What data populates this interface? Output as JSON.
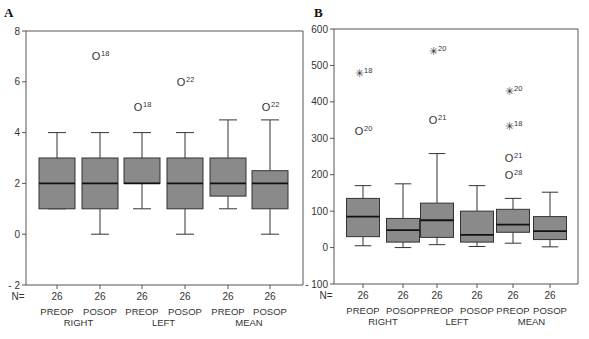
{
  "chart_data": [
    {
      "type": "boxplot",
      "panel_label": "A",
      "ylim": [
        -2,
        8
      ],
      "yticks": [
        -2,
        0,
        2,
        4,
        6,
        8
      ],
      "n_label": "N=",
      "groups": [
        "RIGHT",
        "LEFT",
        "MEAN"
      ],
      "subcategories": [
        "PREOP",
        "POSOP"
      ],
      "boxes": [
        {
          "label": "PREOP",
          "group": "RIGHT",
          "n": "26",
          "whisker_low": 1,
          "q1": 1,
          "median": 2,
          "q3": 3,
          "whisker_high": 4,
          "outliers": []
        },
        {
          "label": "POSOP",
          "group": "RIGHT",
          "n": "26",
          "whisker_low": 0,
          "q1": 1,
          "median": 2,
          "q3": 3,
          "whisker_high": 4,
          "outliers": [
            {
              "value": 7,
              "marker": "o",
              "case": "18"
            }
          ]
        },
        {
          "label": "PREOP",
          "group": "LEFT",
          "n": "26",
          "whisker_low": 1,
          "q1": 2,
          "median": 2,
          "q3": 3,
          "whisker_high": 4,
          "outliers": [
            {
              "value": 5,
              "marker": "o",
              "case": "18"
            }
          ]
        },
        {
          "label": "POSOP",
          "group": "LEFT",
          "n": "26",
          "whisker_low": 0,
          "q1": 1,
          "median": 2,
          "q3": 3,
          "whisker_high": 4,
          "outliers": [
            {
              "value": 6,
              "marker": "o",
              "case": "22"
            }
          ]
        },
        {
          "label": "PREOP",
          "group": "MEAN",
          "n": "26",
          "whisker_low": 1,
          "q1": 1.5,
          "median": 2,
          "q3": 3,
          "whisker_high": 4.5,
          "outliers": []
        },
        {
          "label": "POSOP",
          "group": "MEAN",
          "n": "26",
          "whisker_low": 0,
          "q1": 1,
          "median": 2,
          "q3": 2.5,
          "whisker_high": 4.5,
          "outliers": [
            {
              "value": 5,
              "marker": "o",
              "case": "22"
            }
          ]
        }
      ]
    },
    {
      "type": "boxplot",
      "panel_label": "B",
      "ylim": [
        -100,
        600
      ],
      "yticks": [
        -100,
        0,
        100,
        200,
        300,
        400,
        500,
        600
      ],
      "n_label": "N=",
      "groups": [
        "RIGHT",
        "LEFT",
        "MEAN"
      ],
      "subcategories": [
        "PREOP",
        "POSOP"
      ],
      "boxes": [
        {
          "label": "PREOP",
          "group": "RIGHT",
          "n": "26",
          "whisker_low": 5,
          "q1": 30,
          "median": 85,
          "q3": 135,
          "whisker_high": 170,
          "outliers": [
            {
              "value": 320,
              "marker": "o",
              "case": "20"
            },
            {
              "value": 480,
              "marker": "*",
              "case": "18"
            }
          ]
        },
        {
          "label": "POSOP",
          "group": "RIGHT",
          "n": "26",
          "whisker_low": 0,
          "q1": 15,
          "median": 48,
          "q3": 80,
          "whisker_high": 175,
          "outliers": []
        },
        {
          "label": "PREOP",
          "group": "LEFT",
          "n": "26",
          "whisker_low": 8,
          "q1": 28,
          "median": 75,
          "q3": 122,
          "whisker_high": 258,
          "outliers": [
            {
              "value": 350,
              "marker": "o",
              "case": "21"
            },
            {
              "value": 540,
              "marker": "*",
              "case": "20"
            }
          ]
        },
        {
          "label": "POSOP",
          "group": "LEFT",
          "n": "26",
          "whisker_low": 3,
          "q1": 15,
          "median": 35,
          "q3": 100,
          "whisker_high": 170,
          "outliers": []
        },
        {
          "label": "PREOP",
          "group": "MEAN",
          "n": "26",
          "whisker_low": 12,
          "q1": 42,
          "median": 63,
          "q3": 105,
          "whisker_high": 135,
          "outliers": [
            {
              "value": 200,
              "marker": "o",
              "case": "28"
            },
            {
              "value": 245,
              "marker": "o",
              "case": "21"
            },
            {
              "value": 335,
              "marker": "*",
              "case": "18"
            },
            {
              "value": 430,
              "marker": "*",
              "case": "20"
            }
          ]
        },
        {
          "label": "POSOP",
          "group": "MEAN",
          "n": "26",
          "whisker_low": 2,
          "q1": 22,
          "median": 45,
          "q3": 85,
          "whisker_high": 152,
          "outliers": []
        }
      ]
    }
  ],
  "colors": {
    "box_fill": "#8a8a8a",
    "line": "#333333",
    "frame": "#555555"
  }
}
